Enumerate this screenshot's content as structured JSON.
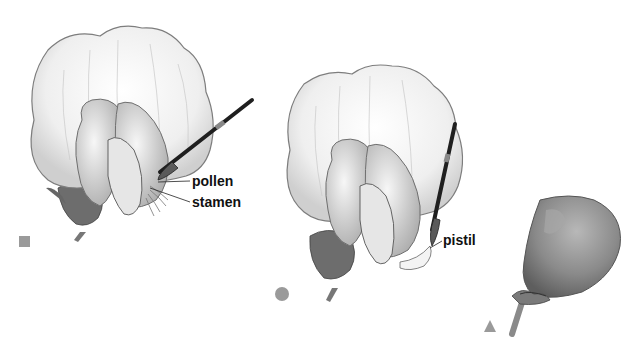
{
  "panels": [
    {
      "id": "step-1",
      "marker": "square",
      "marker_color": "#9a9a9a",
      "labels": [
        "pollen",
        "stamen"
      ]
    },
    {
      "id": "step-2",
      "marker": "circle",
      "marker_color": "#9a9a9a",
      "labels": [
        "pistil"
      ]
    },
    {
      "id": "step-3",
      "marker": "triangle",
      "marker_color": "#9a9a9a",
      "labels": []
    }
  ],
  "colors": {
    "petal_fill": "#f2f2f2",
    "petal_stroke": "#8a8a8a",
    "shade": "#b8b8b8",
    "brush": "#2a2a2a",
    "bag": "#8c8c8c"
  }
}
